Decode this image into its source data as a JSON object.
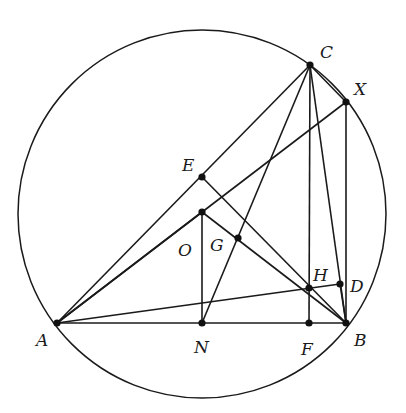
{
  "figure": {
    "type": "geometry-diagram",
    "circle": {
      "center": "O",
      "cx": 202,
      "cy": 214,
      "r": 184
    },
    "points": [
      {
        "name": "A",
        "x": 57,
        "y": 323,
        "label": "A",
        "lx": 36,
        "ly": 346
      },
      {
        "name": "B",
        "x": 346,
        "y": 323,
        "label": "B",
        "lx": 354,
        "ly": 346
      },
      {
        "name": "C",
        "x": 310,
        "y": 65,
        "label": "C",
        "lx": 320,
        "ly": 58
      },
      {
        "name": "X",
        "x": 346,
        "y": 102,
        "label": "X",
        "lx": 354,
        "ly": 95
      },
      {
        "name": "E",
        "x": 202,
        "y": 177,
        "label": "E",
        "lx": 182,
        "ly": 171
      },
      {
        "name": "O",
        "x": 202,
        "y": 212,
        "label": "O",
        "lx": 178,
        "ly": 256
      },
      {
        "name": "G",
        "x": 238,
        "y": 238,
        "label": "G",
        "lx": 210,
        "ly": 251
      },
      {
        "name": "H",
        "x": 309,
        "y": 288,
        "label": "H",
        "lx": 313,
        "ly": 281
      },
      {
        "name": "D",
        "x": 340,
        "y": 284,
        "label": "D",
        "lx": 350,
        "ly": 292
      },
      {
        "name": "N",
        "x": 202,
        "y": 323,
        "label": "N",
        "lx": 194,
        "ly": 353
      },
      {
        "name": "F",
        "x": 309,
        "y": 323,
        "label": "F",
        "lx": 301,
        "ly": 355
      }
    ],
    "segments": [
      [
        "A",
        "B"
      ],
      [
        "A",
        "C"
      ],
      [
        "A",
        "X"
      ],
      [
        "A",
        "D"
      ],
      [
        "A",
        "O"
      ],
      [
        "C",
        "X"
      ],
      [
        "C",
        "F"
      ],
      [
        "C",
        "B"
      ],
      [
        "C",
        "N"
      ],
      [
        "X",
        "B"
      ],
      [
        "E",
        "B"
      ],
      [
        "O",
        "B"
      ],
      [
        "O",
        "N"
      ],
      [
        "D",
        "B"
      ]
    ]
  }
}
